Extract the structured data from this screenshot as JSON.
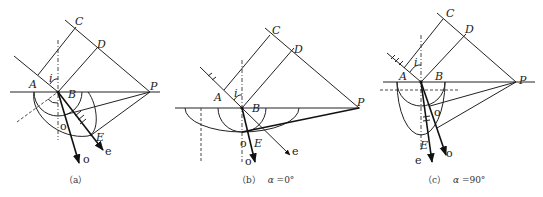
{
  "figure": {
    "panels": [
      {
        "id": "a",
        "caption": "（a）",
        "labels": {
          "A": "A",
          "B": "B",
          "C": "C",
          "D": "D",
          "E": "E",
          "P": "P",
          "i": "i",
          "o_ray": "o",
          "e_ray": "e",
          "o_point": "o"
        }
      },
      {
        "id": "b",
        "caption_prefix": "（b）",
        "caption_var": "α",
        "caption_value": "=0°",
        "labels": {
          "A": "A",
          "B": "B",
          "C": "C",
          "D": "D",
          "E": "E",
          "P": "P",
          "i": "i",
          "o_ray": "o",
          "e_ray": "e",
          "o_point": "o"
        }
      },
      {
        "id": "c",
        "caption_prefix": "（c）",
        "caption_var": "α",
        "caption_value": "=90°",
        "labels": {
          "A": "A",
          "B": "B",
          "C": "C",
          "D": "D",
          "E": "E",
          "P": "P",
          "i": "i",
          "o_ray": "o",
          "e_ray": "e",
          "o_point": "o"
        }
      }
    ]
  }
}
